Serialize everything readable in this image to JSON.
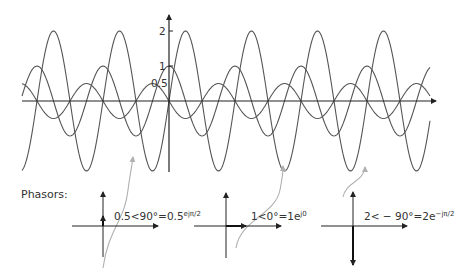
{
  "diagram": {
    "axis": {
      "y_ticks": [
        {
          "label": "2",
          "value": 2
        },
        {
          "label": "1",
          "value": 1
        },
        {
          "label": "0.5",
          "value": 0.5
        }
      ]
    },
    "waves": [
      {
        "name": "wave-half-amplitude",
        "amplitude": 0.5,
        "phase_deg": 90
      },
      {
        "name": "wave-unit-amplitude",
        "amplitude": 1,
        "phase_deg": 0
      },
      {
        "name": "wave-double-amplitude",
        "amplitude": 2,
        "phase_deg": -90
      }
    ],
    "phasors_label": "Phasors:",
    "phasors": [
      {
        "main": "0.5<90°=0.5",
        "sup": "ejπ/2"
      },
      {
        "main": "1<0°=1e",
        "sup": "j0"
      },
      {
        "main": "2< − 90°=2e",
        "sup": "−jπ/2"
      }
    ],
    "colors": {
      "curve": "#555555",
      "axis": "#222222",
      "pointer_arrow": "#b0b0b0"
    }
  }
}
